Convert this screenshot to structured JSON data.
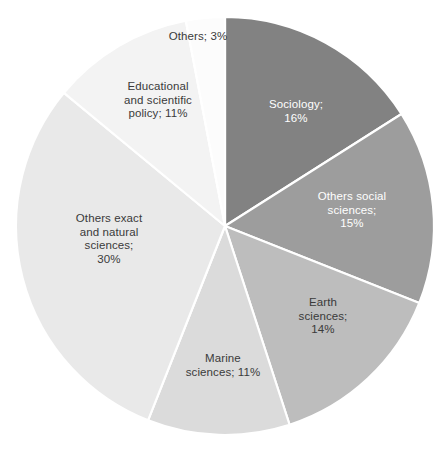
{
  "chart_data": {
    "type": "pie",
    "title": "",
    "subtitle": "",
    "xlabel": "",
    "ylabel": "",
    "legend_position": "none",
    "grid": false,
    "label_format": "{name}; {value}%",
    "start_angle_deg": 0,
    "direction": "clockwise",
    "units": "percent",
    "total": 100,
    "categories": [
      "Sociology",
      "Others social sciences",
      "Earth sciences",
      "Marine sciences",
      "Others exact and natural sciences",
      "Educational and scientific policy",
      "Others"
    ],
    "values": [
      16,
      15,
      14,
      11,
      30,
      11,
      3
    ],
    "colors": [
      "#828282",
      "#9d9d9d",
      "#bdbdbd",
      "#dbdbdb",
      "#e9e9e9",
      "#f3f3f3",
      "#fcfcfc"
    ],
    "slices": [
      {
        "name": "Sociology",
        "value": 16,
        "color": "#828282",
        "label_text": "Sociology;\n16%",
        "label_color": "#ffffff",
        "label_x": 246,
        "label_y": 98,
        "label_width": 100
      },
      {
        "name": "Others social sciences",
        "value": 15,
        "color": "#9d9d9d",
        "label_text": "Others social\nsciences;\n15%",
        "label_color": "#ffffff",
        "label_x": 300,
        "label_y": 190,
        "label_width": 104
      },
      {
        "name": "Earth sciences",
        "value": 14,
        "color": "#bdbdbd",
        "label_text": "Earth\nsciences;\n14%",
        "label_color": "#3a3a3a",
        "label_x": 275,
        "label_y": 296,
        "label_width": 96
      },
      {
        "name": "Marine sciences",
        "value": 11,
        "color": "#dbdbdb",
        "label_text": "Marine\nsciences; 11%",
        "label_color": "#3a3a3a",
        "label_x": 160,
        "label_y": 352,
        "label_width": 126
      },
      {
        "name": "Others exact and natural sciences",
        "value": 30,
        "color": "#e9e9e9",
        "label_text": "Others exact\nand natural\nsciences;\n30%",
        "label_color": "#3a3a3a",
        "label_x": 50,
        "label_y": 212,
        "label_width": 118
      },
      {
        "name": "Educational and scientific policy",
        "value": 11,
        "color": "#f3f3f3",
        "label_text": "Educational\nand scientific\npolicy; 11%",
        "label_color": "#3a3a3a",
        "label_x": 100,
        "label_y": 80,
        "label_width": 116
      },
      {
        "name": "Others",
        "value": 3,
        "color": "#fcfcfc",
        "label_text": "Others; 3%",
        "label_color": "#3a3a3a",
        "label_x": 146,
        "label_y": 30,
        "label_width": 104
      }
    ],
    "geometry": {
      "center_x": 225,
      "center_y": 226,
      "radius": 209
    },
    "separator_color": "#ffffff"
  }
}
